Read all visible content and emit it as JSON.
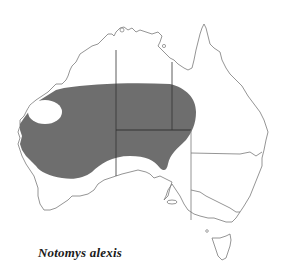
{
  "map": {
    "title": "Notomys alexis",
    "region": "Australia",
    "description": "Distribution map (shaded range)",
    "colors": {
      "range_fill": "#6e6e6e",
      "outline": "#7a7a7a",
      "border": "#333333",
      "background": "#ffffff"
    },
    "states": [
      "Western Australia",
      "Northern Territory",
      "South Australia",
      "Queensland",
      "New South Wales",
      "Victoria",
      "Tasmania"
    ]
  },
  "caption": {
    "species_name": "Notomys alexis"
  }
}
